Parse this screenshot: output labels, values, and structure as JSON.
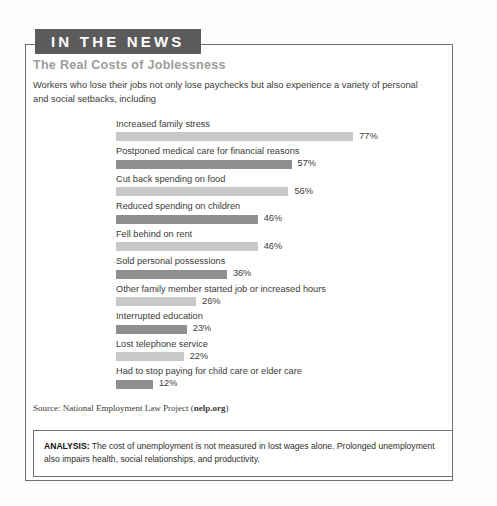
{
  "banner": {
    "label": "IN THE NEWS"
  },
  "headline": "The Real Costs of Joblessness",
  "intro": "Workers who lose their jobs not only lose paychecks but also experience a variety of personal and social setbacks, including",
  "chart_data": {
    "type": "bar",
    "title": "The Real Costs of Joblessness",
    "xlabel": "",
    "ylabel": "",
    "xlim": [
      0,
      100
    ],
    "grid": false,
    "legend": "none",
    "orientation": "horizontal",
    "unit": "%",
    "categories": [
      "Increased family stress",
      "Postponed medical care for financial reasons",
      "Cut back spending on food",
      "Reduced spending on children",
      "Fell behind on rent",
      "Sold personal possessions",
      "Other family member started job or increased hours",
      "Interrupted education",
      "Lost telephone service",
      "Had to stop paying for child care or elder care"
    ],
    "values": [
      77,
      57,
      56,
      46,
      46,
      36,
      26,
      23,
      22,
      12
    ],
    "value_labels": [
      "77%",
      "57%",
      "56%",
      "46%",
      "46%",
      "36%",
      "26%",
      "23%",
      "22%",
      "12%"
    ],
    "bar_colors": [
      "#c8c8c8",
      "#8f8f8f",
      "#c8c8c8",
      "#8f8f8f",
      "#c8c8c8",
      "#8f8f8f",
      "#c8c8c8",
      "#8f8f8f",
      "#c8c8c8",
      "#8f8f8f"
    ],
    "px_per_percent": 3.08
  },
  "source": {
    "prefix": "Source: National Employment Law Project (",
    "link": "nelp.org",
    "suffix": ")"
  },
  "analysis": {
    "lead": "ANALYSIS:",
    "body": " The cost of unemployment is not measured in lost wages alone. Prolonged unemployment also impairs health, social relationships, and productivity."
  },
  "colors": {
    "banner_bg": "#5b5b5b",
    "headline": "#9c9c99",
    "bar_light": "#c8c8c8",
    "bar_dark": "#8f8f8f",
    "frame_border": "#6e6e6e"
  }
}
